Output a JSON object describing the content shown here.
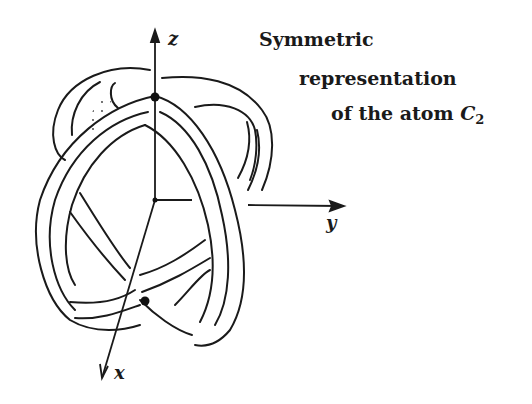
{
  "caption": {
    "line1": "Symmetric",
    "line2": "representation",
    "line3_prefix": "of the atom ",
    "atom_symbol": "C",
    "atom_subscript": "2"
  },
  "axes": {
    "z": "z",
    "y": "y",
    "x": "x"
  },
  "colors": {
    "ink": "#1a1a1a",
    "background": "#ffffff"
  }
}
